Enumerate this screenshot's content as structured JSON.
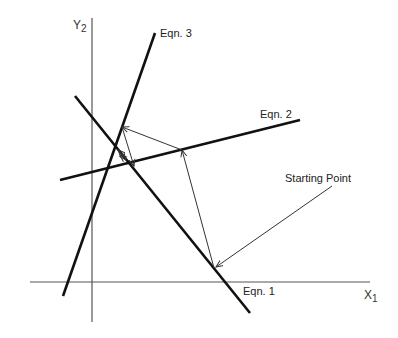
{
  "diagram": {
    "axes": {
      "x_label": "X",
      "x_sub": "1",
      "y_label": "Y",
      "y_sub": "2"
    },
    "lines": [
      {
        "id": "eqn1",
        "label": "Eqn. 1",
        "from": [
          75,
          96
        ],
        "to": [
          250,
          313
        ]
      },
      {
        "id": "eqn2",
        "label": "Eqn. 2",
        "from": [
          60,
          180
        ],
        "to": [
          300,
          120
        ]
      },
      {
        "id": "eqn3",
        "label": "Eqn. 3",
        "from": [
          63,
          296
        ],
        "to": [
          155,
          33
        ]
      }
    ],
    "annotation": {
      "label": "Starting Point",
      "pointer_from": [
        332,
        186
      ],
      "pointer_to": [
        216,
        267
      ]
    },
    "iteration_path": [
      [
        214,
        268
      ],
      [
        182,
        150
      ],
      [
        122,
        127
      ],
      [
        134,
        166
      ],
      [
        118,
        150
      ],
      [
        126,
        160
      ],
      [
        120,
        155
      ]
    ],
    "colors": {
      "line": "#111111",
      "axis": "#555555",
      "path": "#333333",
      "background": "#ffffff"
    }
  }
}
